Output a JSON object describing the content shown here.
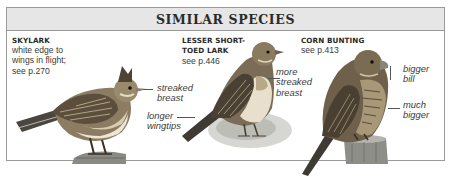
{
  "panel": {
    "title": "SIMILAR SPECIES",
    "background_header": "#e6e6e6",
    "border_color": "#9a9a9a"
  },
  "species": [
    {
      "name": "SKYLARK",
      "description": [
        "white edge to",
        "wings in flight;",
        "see p.270"
      ],
      "annotations": [
        {
          "lines": [
            "streaked",
            "breast"
          ]
        },
        {
          "lines": [
            "longer",
            "wingtips"
          ]
        }
      ],
      "icon": "skylark-illustration"
    },
    {
      "name_lines": [
        "LESSER SHORT-",
        "TOED LARK"
      ],
      "description": [
        "see p.446"
      ],
      "annotations": [
        {
          "lines": [
            "more",
            "streaked",
            "breast"
          ]
        }
      ],
      "icon": "lesser-short-toed-lark-illustration"
    },
    {
      "name": "CORN BUNTING",
      "description": [
        "see p.413"
      ],
      "annotations": [
        {
          "lines": [
            "bigger",
            "bill"
          ]
        },
        {
          "lines": [
            "much",
            "bigger"
          ]
        }
      ],
      "icon": "corn-bunting-illustration"
    }
  ]
}
